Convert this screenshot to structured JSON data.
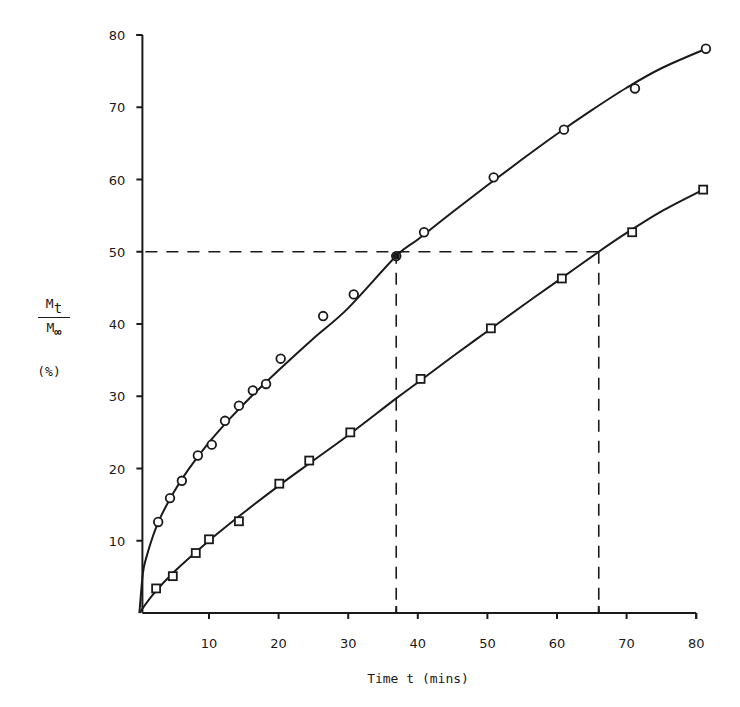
{
  "chart_data": {
    "type": "scatter",
    "title": "",
    "xlabel": "Time t (mins)",
    "ylabel": "Mt / M∞ (%)",
    "ylabel_parts": {
      "num": "M",
      "num_sub": "t",
      "den": "M",
      "den_sub": "∞",
      "unit": "(%)"
    },
    "xlim": [
      0,
      80
    ],
    "ylim": [
      0,
      80
    ],
    "x_ticks": [
      10,
      20,
      30,
      40,
      50,
      60,
      70,
      80
    ],
    "y_ticks": [
      10,
      20,
      30,
      40,
      50,
      60,
      70,
      80
    ],
    "grid": false,
    "legend": null,
    "series": [
      {
        "name": "circles",
        "marker": "circle",
        "points": [
          [
            2.7,
            12.6
          ],
          [
            4.4,
            15.9
          ],
          [
            6.1,
            18.3
          ],
          [
            8.4,
            21.8
          ],
          [
            10.4,
            23.3
          ],
          [
            12.3,
            26.6
          ],
          [
            14.3,
            28.7
          ],
          [
            16.3,
            30.8
          ],
          [
            18.2,
            31.7
          ],
          [
            20.3,
            35.2
          ],
          [
            26.4,
            41.1
          ],
          [
            30.8,
            44.1
          ],
          [
            36.9,
            49.4
          ],
          [
            40.9,
            52.7
          ],
          [
            50.9,
            60.3
          ],
          [
            61.0,
            66.9
          ],
          [
            71.2,
            72.6
          ],
          [
            81.4,
            78.1
          ]
        ],
        "fit_curve": [
          [
            0,
            0
          ],
          [
            0.5,
            5.5
          ],
          [
            1,
            7.7
          ],
          [
            2,
            10.8
          ],
          [
            3,
            13.2
          ],
          [
            5,
            16.8
          ],
          [
            7,
            19.8
          ],
          [
            10,
            23.6
          ],
          [
            13,
            26.9
          ],
          [
            16,
            29.9
          ],
          [
            20,
            33.6
          ],
          [
            25,
            38.0
          ],
          [
            30,
            42.2
          ],
          [
            36.9,
            49.4
          ],
          [
            40,
            51.7
          ],
          [
            45,
            55.5
          ],
          [
            50,
            59.2
          ],
          [
            55,
            62.8
          ],
          [
            60,
            66.3
          ],
          [
            65,
            69.6
          ],
          [
            70,
            72.7
          ],
          [
            75,
            75.4
          ],
          [
            81.4,
            78.1
          ]
        ]
      },
      {
        "name": "squares",
        "marker": "square",
        "points": [
          [
            2.4,
            3.4
          ],
          [
            4.8,
            5.1
          ],
          [
            8.1,
            8.3
          ],
          [
            10.0,
            10.2
          ],
          [
            14.3,
            12.7
          ],
          [
            20.1,
            17.9
          ],
          [
            24.4,
            21.1
          ],
          [
            30.3,
            25.0
          ],
          [
            40.4,
            32.4
          ],
          [
            50.5,
            39.4
          ],
          [
            60.7,
            46.3
          ],
          [
            70.8,
            52.7
          ],
          [
            81.0,
            58.6
          ]
        ],
        "fit_curve": [
          [
            0,
            0
          ],
          [
            2,
            2.6
          ],
          [
            5,
            5.7
          ],
          [
            10,
            10.0
          ],
          [
            15,
            13.9
          ],
          [
            20,
            17.6
          ],
          [
            25,
            21.1
          ],
          [
            30,
            24.6
          ],
          [
            36.9,
            29.7
          ],
          [
            40,
            31.9
          ],
          [
            45,
            35.5
          ],
          [
            50,
            39.0
          ],
          [
            55,
            42.5
          ],
          [
            60,
            45.9
          ],
          [
            66.0,
            50.0
          ],
          [
            70,
            52.6
          ],
          [
            75,
            55.6
          ],
          [
            81.0,
            58.6
          ]
        ]
      }
    ],
    "annotations": [
      {
        "type": "hline_dashed",
        "y": 50,
        "x_from": 0,
        "x_to": 66.0
      },
      {
        "type": "vline_dashed",
        "x": 36.9,
        "y_from": 0,
        "y_to": 50
      },
      {
        "type": "vline_dashed",
        "x": 66.0,
        "y_from": 0,
        "y_to": 50
      }
    ]
  }
}
